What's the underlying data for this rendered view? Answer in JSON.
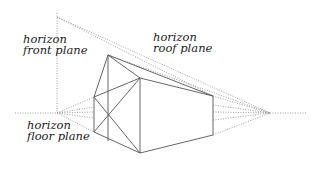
{
  "labels": {
    "front_plane": {
      "line1": "horizon",
      "line2": "front plane"
    },
    "roof_plane": {
      "line1": "horizon",
      "line2": "roof plane"
    },
    "floor_plane": {
      "line1": "horizon",
      "line2": "floor plane"
    }
  },
  "colors": {
    "line": "#555555",
    "dotted": "#888888",
    "text": "#222222",
    "background": "#ffffff"
  }
}
